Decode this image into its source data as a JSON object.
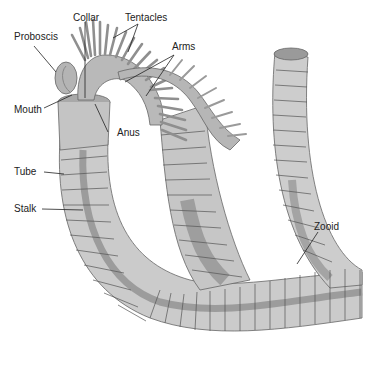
{
  "diagram": {
    "labels": {
      "collar": "Collar",
      "tentacles": "Tentacles",
      "proboscis": "Proboscis",
      "arms": "Arms",
      "mouth": "Mouth",
      "anus": "Anus",
      "tube": "Tube",
      "stalk": "Stalk",
      "zooid": "Zooid"
    },
    "colors": {
      "tube_fill": "#c8c8c8",
      "tube_light": "#dadada",
      "stalk_fill": "#9a9a9a",
      "ring_line": "#555555",
      "leader_line": "#222222",
      "background": "#ffffff"
    }
  }
}
